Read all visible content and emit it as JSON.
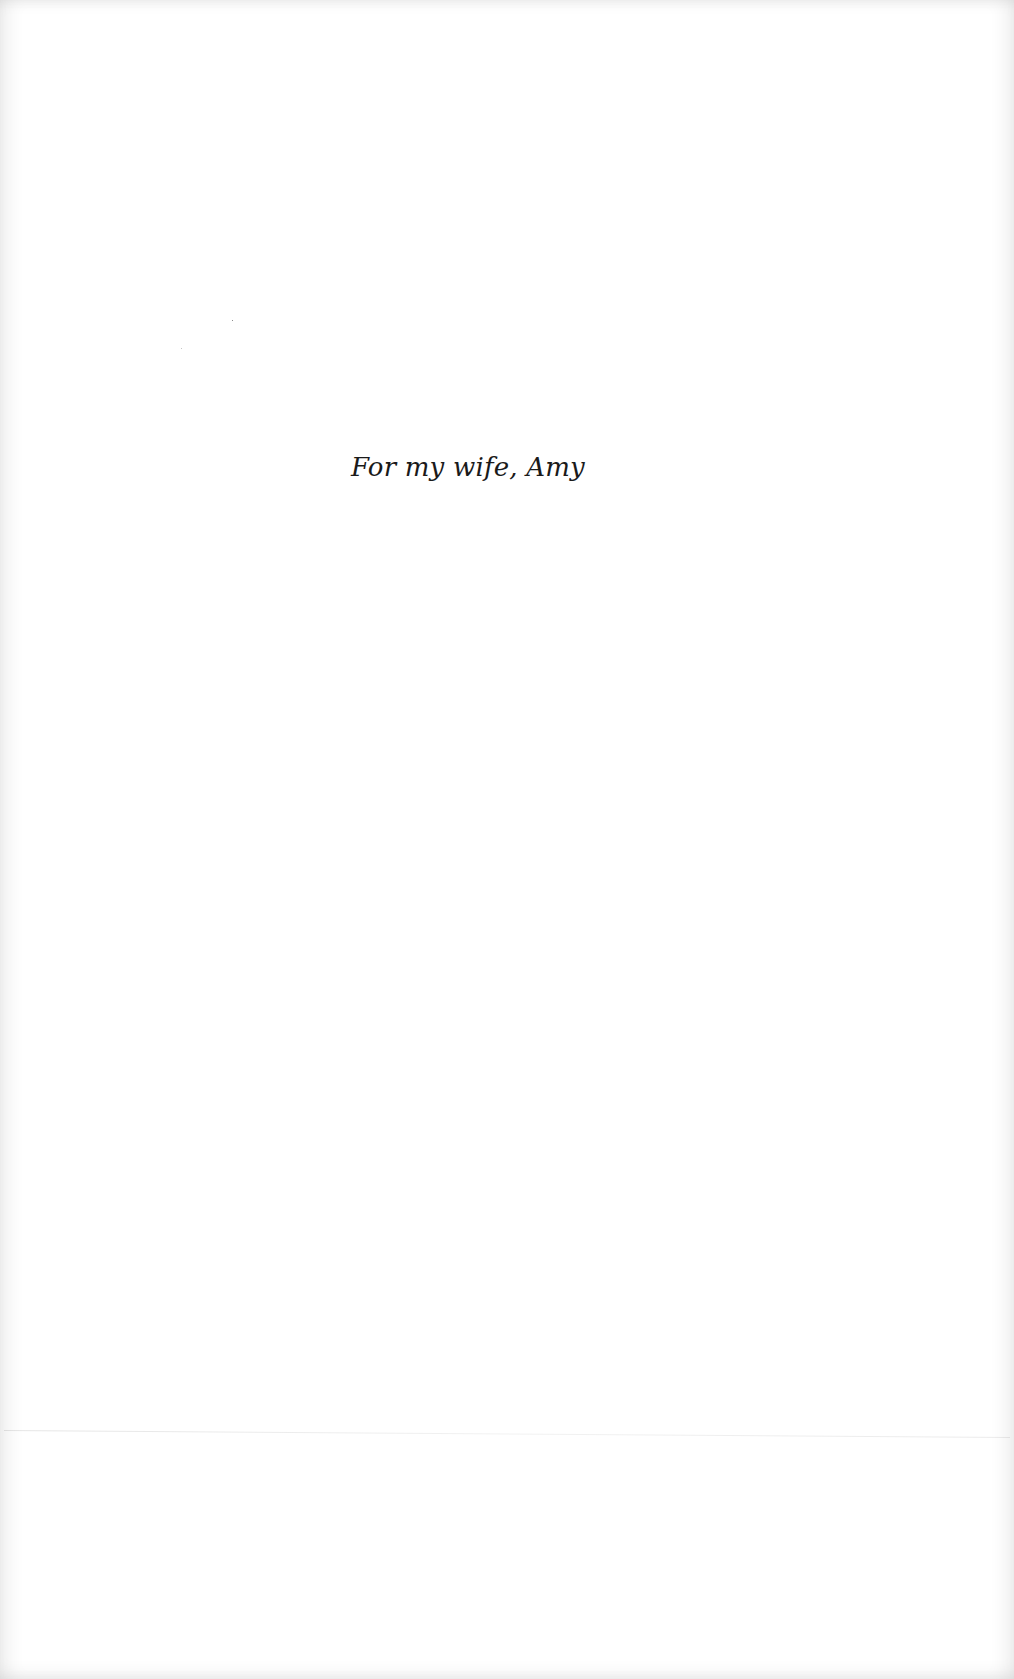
{
  "page": {
    "type": "dedication",
    "dedication_text": "For my wife, Amy"
  },
  "colors": {
    "background": "#ffffff",
    "text": "#1a1a1a"
  }
}
